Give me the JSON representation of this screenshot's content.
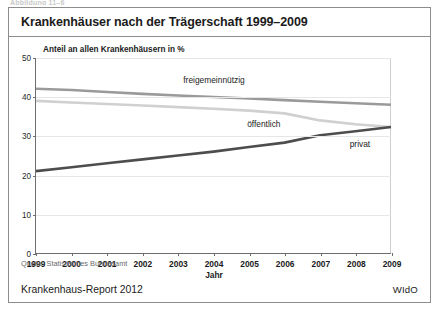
{
  "top_stub": "Abbildung 11–6",
  "figure": {
    "title": "Krankenhäuser nach der Trägerschaft 1999–2009",
    "subtitle": "Anteil an allen Krankenhäusern in %",
    "source": "Quelle: Statistisches Bundesamt",
    "footer_left": "Krankenhaus-Report 2012",
    "footer_right": "WIdO"
  },
  "chart_data": {
    "type": "line",
    "title": "Krankenhäuser nach der Trägerschaft 1999–2009",
    "subtitle": "Anteil an allen Krankenhäusern in %",
    "xlabel": "Jahr",
    "ylabel": "Anteil an allen Krankenhäusern in %",
    "x": [
      1999,
      2000,
      2001,
      2002,
      2003,
      2004,
      2005,
      2006,
      2007,
      2008,
      2009
    ],
    "xtick_labels": [
      "1999",
      "2000",
      "2001",
      "2002",
      "2003",
      "2004",
      "2005",
      "2006",
      "2007",
      "2008",
      "2009"
    ],
    "ytick_labels": [
      "0",
      "10",
      "20",
      "30",
      "40",
      "50"
    ],
    "yticks": [
      0,
      10,
      20,
      30,
      40,
      50
    ],
    "xlim": [
      1999,
      2009
    ],
    "ylim": [
      0,
      50
    ],
    "grid": true,
    "legend_position": "inline-annotations",
    "series": [
      {
        "name": "freigemeinnützig",
        "color": "#9a9a9a",
        "width": 2.6,
        "label_x": 2004.0,
        "label_y": 44.5,
        "values": [
          42.1,
          41.8,
          41.3,
          40.8,
          40.4,
          40.0,
          39.6,
          39.2,
          38.8,
          38.4,
          38.0
        ]
      },
      {
        "name": "öffentlich",
        "color": "#d0d0d0",
        "width": 2.6,
        "label_x": 2005.4,
        "label_y": 33.2,
        "values": [
          39.0,
          38.6,
          38.2,
          37.8,
          37.4,
          37.0,
          36.5,
          35.8,
          34.0,
          33.0,
          32.3
        ]
      },
      {
        "name": "privat",
        "color": "#4d4d4d",
        "width": 2.6,
        "label_x": 2008.1,
        "label_y": 28.0,
        "values": [
          21.0,
          22.0,
          23.0,
          24.0,
          25.0,
          26.0,
          27.2,
          28.3,
          30.2,
          31.2,
          32.3
        ]
      }
    ]
  }
}
